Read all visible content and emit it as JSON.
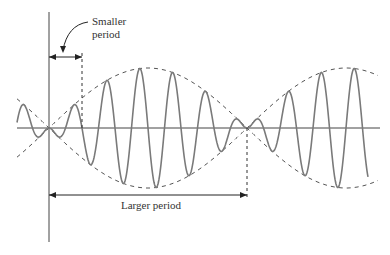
{
  "diagram": {
    "labels": {
      "smaller_period": [
        "Smaller",
        "period"
      ],
      "larger_period": "Larger period"
    },
    "geometry": {
      "axis_x": {
        "x1": 17,
        "x2": 380,
        "y": 128
      },
      "axis_y": {
        "x": 49,
        "y1": 12,
        "y2": 242
      },
      "wave_start_x": 17,
      "wave_end_x": 368,
      "envelope_start_x": 17,
      "envelope_end_x": 378,
      "node_x": 49,
      "beat_half_period_px": 99,
      "carrier_period_px": 33,
      "amplitude_px": 60,
      "smaller_period": {
        "x1": 49,
        "x2": 82,
        "y": 57
      },
      "larger_period": {
        "x1": 49,
        "x2": 247,
        "y": 195
      }
    },
    "colors": {
      "axis": "#444444",
      "wave": "#7a7a7a",
      "envelope": "#555555",
      "annotation": "#222222"
    }
  }
}
